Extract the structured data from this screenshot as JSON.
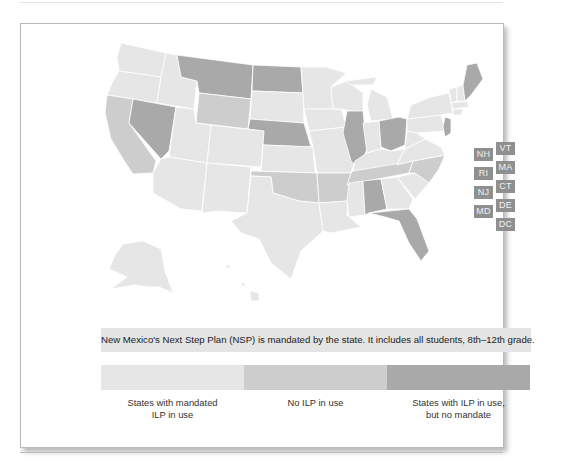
{
  "colors": {
    "mandated": "#e6e6e6",
    "no_ilp": "#cdcdcd",
    "ilp_no_mandate": "#a9a9a9",
    "abbr_box": "#8f8f8f",
    "note_bg": "#e4e4e4"
  },
  "map": {
    "small_state_labels": [
      {
        "abbr": "NH",
        "category": "ilp_no_mandate"
      },
      {
        "abbr": "VT",
        "category": "ilp_no_mandate"
      },
      {
        "abbr": "RI",
        "category": "ilp_no_mandate"
      },
      {
        "abbr": "MA",
        "category": "ilp_no_mandate"
      },
      {
        "abbr": "NJ",
        "category": "ilp_no_mandate"
      },
      {
        "abbr": "CT",
        "category": "ilp_no_mandate"
      },
      {
        "abbr": "MD",
        "category": "ilp_no_mandate"
      },
      {
        "abbr": "DE",
        "category": "ilp_no_mandate"
      },
      {
        "abbr": "DC",
        "category": "ilp_no_mandate"
      }
    ],
    "state_categories": {
      "ilp_no_mandate": [
        "MT",
        "ND",
        "NV",
        "NE",
        "IL",
        "OH",
        "AL",
        "FL",
        "ME",
        "NJ"
      ],
      "no_ilp": [
        "CA",
        "WY",
        "OK",
        "AR",
        "NC",
        "TN"
      ],
      "mandated": [
        "WA",
        "OR",
        "ID",
        "UT",
        "AZ",
        "NM",
        "CO",
        "SD",
        "KS",
        "TX",
        "MN",
        "IA",
        "MO",
        "WI",
        "MI",
        "IN",
        "KY",
        "LA",
        "MS",
        "GA",
        "SC",
        "VA",
        "WV",
        "PA",
        "NY",
        "AK",
        "HI"
      ]
    }
  },
  "note": {
    "text": "New Mexico's Next Step Plan (NSP) is mandated by the state. It includes all students, 8th–12th grade."
  },
  "legend": {
    "items": [
      {
        "line1": "States with mandated",
        "line2": "ILP in use",
        "color": "#e6e6e6"
      },
      {
        "line1": "No ILP in use",
        "line2": "",
        "color": "#cdcdcd"
      },
      {
        "line1": "States with ILP in use,",
        "line2": "but no mandate",
        "color": "#a9a9a9"
      }
    ]
  }
}
